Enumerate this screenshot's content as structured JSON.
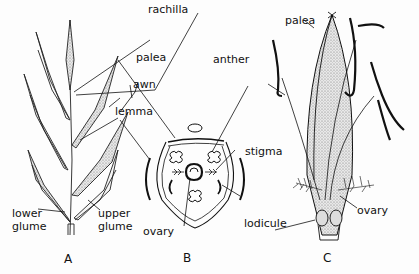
{
  "figure": {
    "panels": [
      {
        "id": "A",
        "label": "A",
        "subject": "grass spikelet"
      },
      {
        "id": "B",
        "label": "B",
        "subject": "floral diagram (cross-section)"
      },
      {
        "id": "C",
        "label": "C",
        "subject": "grass floret"
      }
    ],
    "labels": {
      "rachilla": "rachilla",
      "palea_b": "palea",
      "awn": "awn",
      "lemma": "lemma",
      "lower_glume": "lower\nglume",
      "lower_glume_1": "lower",
      "lower_glume_2": "glume",
      "upper_glume_1": "upper",
      "upper_glume_2": "glume",
      "ovary_b": "ovary",
      "anther": "anther",
      "stigma": "stigma",
      "lodicule": "lodicule",
      "palea_c": "palea",
      "ovary_c": "ovary"
    },
    "colors": {
      "ink": "#111111",
      "stipple": "#bdbdbd",
      "background": "#fdfdfd"
    }
  }
}
